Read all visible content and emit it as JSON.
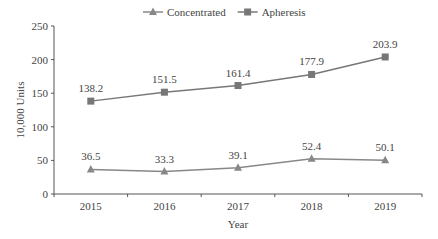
{
  "chart_data": {
    "type": "line",
    "title": "",
    "categories": [
      "2015",
      "2016",
      "2017",
      "2018",
      "2019"
    ],
    "series": [
      {
        "name": "Concentrated",
        "marker": "triangle",
        "values": [
          36.5,
          33.3,
          39.1,
          52.4,
          50.1
        ]
      },
      {
        "name": "Apheresis",
        "marker": "square",
        "values": [
          138.2,
          151.5,
          161.4,
          177.9,
          203.9
        ]
      }
    ],
    "xlabel": "Year",
    "ylabel": "10,000 Units",
    "ylim": [
      0,
      250
    ],
    "yticks": [
      0,
      50,
      100,
      150,
      200,
      250
    ],
    "grid": false,
    "legend_position": "top",
    "colors": {
      "Concentrated": "#888888",
      "Apheresis": "#777777"
    }
  }
}
